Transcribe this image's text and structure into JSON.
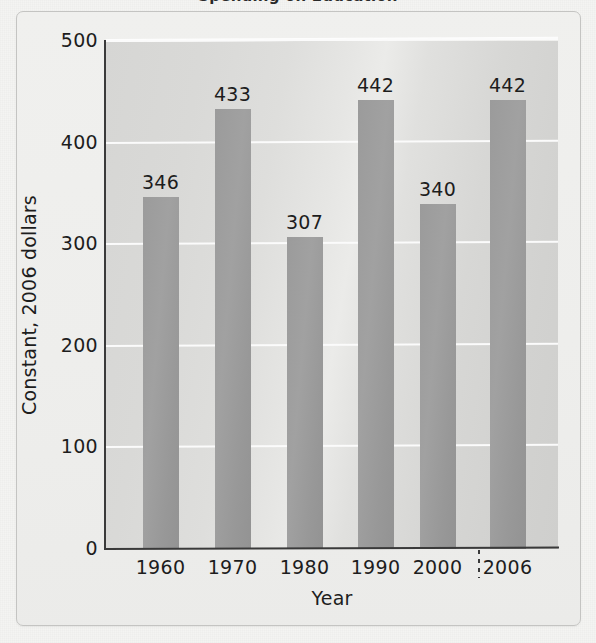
{
  "figure": {
    "title_clipped": "Spending on Education",
    "frame": true
  },
  "chart_data": {
    "type": "bar",
    "title": "",
    "xlabel": "Year",
    "ylabel": "Constant, 2006 dollars",
    "categories": [
      "1960",
      "1970",
      "1980",
      "1990",
      "2000",
      "2006"
    ],
    "values": [
      346,
      433,
      307,
      442,
      340,
      442
    ],
    "value_labels": [
      "346",
      "433",
      "307",
      "442",
      "340",
      "442"
    ],
    "ylim": [
      0,
      500
    ],
    "yticks": [
      0,
      100,
      200,
      300,
      400,
      500
    ],
    "ytick_labels": [
      "0",
      "100",
      "200",
      "300",
      "400",
      "500"
    ],
    "grid": true,
    "grid_axis": "y",
    "legend": null,
    "bar_color": "#9b9b9b",
    "plot_background": "#d9d9d7",
    "gridline_color": "#fbfbfb",
    "axis_color": "#3a3a3a",
    "annotations": [
      {
        "name": "projection-separator",
        "between": [
          "2000",
          "2006"
        ],
        "style": "dotted-vertical"
      }
    ]
  }
}
